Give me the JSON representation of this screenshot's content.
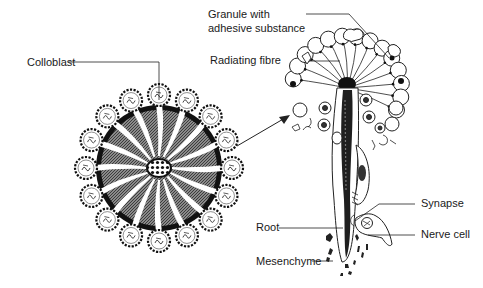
{
  "diagram": {
    "type": "biological-illustration",
    "labels": {
      "colloblast": "Colloblast",
      "granule_line1": "Granule with",
      "granule_line2": "adhesive substance",
      "radiating_fibre": "Radiating fibre",
      "synapse": "Synapse",
      "root": "Root",
      "nerve_cell": "Nerve cell",
      "mesenchyme": "Mesenchyme"
    },
    "left_figure": {
      "name": "colloblast-surface-view",
      "lobe_count": 16
    },
    "right_figure": {
      "name": "colloblast-section-view"
    },
    "colors": {
      "ink": "#1a1a1a",
      "shade": "#6b6b6b",
      "background": "#ffffff"
    }
  }
}
